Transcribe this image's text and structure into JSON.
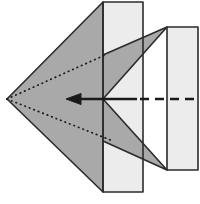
{
  "figure": {
    "type": "origami-fold-diagram",
    "canvas": {
      "width": 200,
      "height": 204,
      "background": "#ffffff"
    },
    "palette": {
      "paper_light": "#ececec",
      "paper_light_alt": "#e4e4e4",
      "paper_gray": "#a9a9a9",
      "paper_gray_dark": "#9d9d9d",
      "outline": "#2b2b2b",
      "fold_line": "#1a1a1a",
      "arrow": "#1a1a1a",
      "background": "#ffffff"
    },
    "stroke_widths": {
      "outline": 1.6,
      "fold_dotted": 1.7,
      "arrow_shaft": 2.6,
      "arrow_dashed": 2.6
    },
    "shapes": [
      {
        "name": "right-light-panel",
        "kind": "polygon",
        "fill": "#ececec",
        "points": "167,27 198,27 198,170 167,170"
      },
      {
        "name": "center-light-strip",
        "kind": "polygon",
        "fill": "#ececec",
        "points": "103,2 143,2 143,192 103,192"
      },
      {
        "name": "upper-right-gray-flap",
        "kind": "polygon",
        "fill": "#a9a9a9",
        "points": "103,55 167,27 103,99"
      },
      {
        "name": "lower-right-gray-flap",
        "kind": "polygon",
        "fill": "#a9a9a9",
        "points": "103,99 167,170 103,141"
      },
      {
        "name": "main-gray-arrow-body",
        "kind": "polygon",
        "fill": "#a9a9a9",
        "points": "7,99 103,2 103,192"
      }
    ],
    "outlines": [
      {
        "name": "main-gray-arrow-outline",
        "points": "7,99 103,2 103,192 7,99"
      },
      {
        "name": "center-strip-outline",
        "points": "103,2 143,2 143,192 103,192 103,2"
      },
      {
        "name": "right-panel-outline",
        "points": "167,27 198,27 198,170 167,170 167,27"
      },
      {
        "name": "upper-right-flap-outline",
        "points": "103,55 167,27 103,99"
      },
      {
        "name": "lower-right-flap-outline",
        "points": "103,99 167,170 103,141"
      }
    ],
    "fold_lines": [
      {
        "name": "upper-valley-fold",
        "style": "dotted",
        "from": [
          7,
          99
        ],
        "to": [
          105,
          55
        ],
        "meaning": "valley fold (hidden edge)"
      },
      {
        "name": "lower-valley-fold",
        "style": "dotted",
        "from": [
          7,
          99
        ],
        "to": [
          113,
          141
        ],
        "meaning": "valley fold (hidden edge)"
      }
    ],
    "arrows": [
      {
        "name": "fold-direction-arrow",
        "style": "solid-with-head",
        "direction": "left",
        "shaft_from": [
          137,
          99
        ],
        "shaft_to": [
          66,
          99
        ],
        "head_tip": [
          66,
          99
        ],
        "head_width": 11,
        "head_length": 14,
        "meaning": "fold this edge toward the left point"
      },
      {
        "name": "reference-dashed-line",
        "style": "dashed",
        "from": [
          140,
          99
        ],
        "to": [
          200,
          99
        ],
        "dash_pattern": "9 6",
        "meaning": "hidden / reference center line"
      }
    ]
  }
}
